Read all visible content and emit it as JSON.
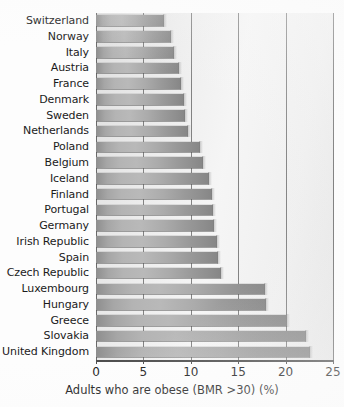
{
  "chart_data": {
    "type": "bar",
    "orientation": "horizontal",
    "title": "",
    "xlabel": "Adults who are obese (BMR >30) (%)",
    "ylabel": "",
    "xlim": [
      0,
      25
    ],
    "xticks": [
      0,
      5,
      10,
      15,
      20,
      25
    ],
    "xtick_labels": [
      "0",
      "5",
      "10",
      "15",
      "20",
      "25"
    ],
    "grid": true,
    "grid_axis": "x",
    "legend": false,
    "categories": [
      "Switzerland",
      "Norway",
      "Italy",
      "Austria",
      "France",
      "Denmark",
      "Sweden",
      "Netherlands",
      "Poland",
      "Belgium",
      "Iceland",
      "Finland",
      "Portugal",
      "Germany",
      "Irish Republic",
      "Spain",
      "Czech Republic",
      "Luxembourg",
      "Hungary",
      "Greece",
      "Slovakia",
      "United Kingdom"
    ],
    "values": [
      7.2,
      7.9,
      8.2,
      8.8,
      9.0,
      9.3,
      9.4,
      9.7,
      11.0,
      11.3,
      11.9,
      12.2,
      12.3,
      12.4,
      12.8,
      12.9,
      13.2,
      17.8,
      17.9,
      20.2,
      22.1,
      22.6
    ],
    "bar_color": "#ababab",
    "grid_color": "#6f6f6f",
    "axis_color": "#4a4a4a"
  },
  "axis": {
    "x_title": "Adults who are obese (BMR >30) (%)"
  }
}
